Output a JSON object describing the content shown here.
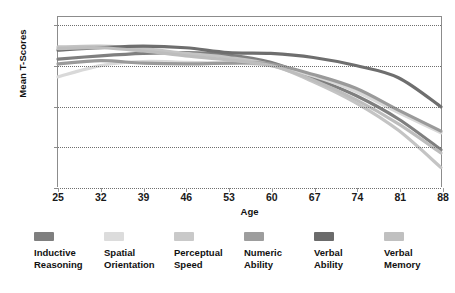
{
  "chart_data": {
    "type": "line",
    "title": "",
    "xlabel": "Age",
    "ylabel": "Mean T-Scores",
    "xlim": [
      25,
      88
    ],
    "ylim": [
      35,
      56
    ],
    "grid": true,
    "grid_axis": "y",
    "legend_position": "below",
    "x_ticks": [
      25,
      32,
      39,
      46,
      53,
      60,
      67,
      74,
      81,
      88
    ],
    "y_ticks": [
      35,
      40,
      45,
      50,
      55
    ],
    "x": [
      25,
      32,
      39,
      46,
      53,
      60,
      67,
      74,
      81,
      88
    ],
    "series": [
      {
        "name": "Inductive Reasoning",
        "color": "#7f7f7f",
        "values": [
          50.8,
          51.2,
          51.5,
          51.6,
          51.3,
          50.4,
          48.5,
          46.3,
          43.4,
          39.6
        ]
      },
      {
        "name": "Spatial Orientation",
        "color": "#d9d9d9",
        "values": [
          48.6,
          50.0,
          50.5,
          50.4,
          50.3,
          50.0,
          48.7,
          46.8,
          44.2,
          41.7
        ]
      },
      {
        "name": "Perceptual Speed",
        "color": "#c4c4c4",
        "values": [
          52.3,
          52.4,
          52.1,
          51.5,
          51.0,
          50.1,
          48.0,
          45.4,
          42.0,
          37.4
        ]
      },
      {
        "name": "Numeric Ability",
        "color": "#9a9a9a",
        "values": [
          50.2,
          50.6,
          50.3,
          50.2,
          50.3,
          50.2,
          48.9,
          47.2,
          44.5,
          41.9
        ]
      },
      {
        "name": "Verbal Ability",
        "color": "#6e6e6e",
        "values": [
          51.9,
          52.2,
          52.4,
          52.2,
          51.6,
          51.5,
          51.0,
          50.0,
          48.5,
          44.9
        ]
      },
      {
        "name": "Verbal Memory",
        "color": "#bdbdbd",
        "values": [
          52.1,
          52.2,
          51.8,
          51.2,
          50.7,
          50.0,
          48.2,
          45.8,
          42.8,
          39.2
        ]
      }
    ]
  },
  "axes": {
    "y_title": "Mean T-Scores",
    "x_title": "Age",
    "y_tick_labels": [
      "55",
      "50",
      "45",
      "40",
      "35"
    ],
    "x_tick_labels": [
      "25",
      "32",
      "39",
      "46",
      "53",
      "60",
      "67",
      "74",
      "81",
      "88"
    ]
  },
  "legend": {
    "items": [
      {
        "label": "Inductive\nReasoning",
        "color": "#7f7f7f"
      },
      {
        "label": "Spatial\nOrientation",
        "color": "#dcdcdc"
      },
      {
        "label": "Perceptual\nSpeed",
        "color": "#c9c9c9"
      },
      {
        "label": "Numeric\nAbility",
        "color": "#9d9d9d"
      },
      {
        "label": "Verbal\nAbility",
        "color": "#6b6b6b"
      },
      {
        "label": "Verbal\nMemory",
        "color": "#c0c0c0"
      }
    ]
  },
  "style": {
    "frame_color": "#8c8c8c",
    "grid_color": "#6f6f6f",
    "background": "#ffffff"
  }
}
